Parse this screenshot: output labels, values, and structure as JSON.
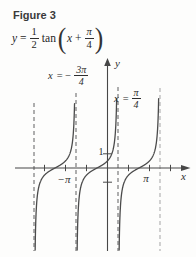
{
  "figure": {
    "title": "Figure 3",
    "equation": {
      "lhs": "y",
      "equals": "=",
      "frac1": {
        "num": "1",
        "den": "2"
      },
      "func": "tan",
      "open_paren": "(",
      "arg_var": "x",
      "plus": "+",
      "frac2": {
        "num": "π",
        "den": "4"
      },
      "close_paren": ")"
    }
  },
  "graph": {
    "axis_labels": {
      "x": "x",
      "y": "y"
    },
    "tick_labels": {
      "one": "1",
      "neg_pi": "−π",
      "pi": "π"
    },
    "asymptote_labels": {
      "left": {
        "var": "x",
        "rel": "= −",
        "num": "3π",
        "den": "4"
      },
      "right": {
        "var": "x",
        "rel": "=",
        "num": "π",
        "den": "4"
      }
    }
  },
  "chart_data": {
    "type": "line",
    "function": "y = 0.5 · tan(x + π/4)",
    "coefficient": 0.5,
    "phase_shift_rad": 0.7853981633974483,
    "period_rad": 3.141592653589793,
    "asymptotes_x_rad": [
      -5.497787143782138,
      -2.356194490192345,
      0.7853981633974483,
      3.9269908169872414
    ],
    "zeros_x_rad": [
      -3.9269908169872414,
      -0.7853981633974483,
      2.356194490192345
    ],
    "y_intercept": 0.5,
    "x_ticks_rad": [
      -4.71238898038469,
      -3.141592653589793,
      -1.5707963267948966,
      1.5707963267948966,
      3.141592653589793,
      4.71238898038469
    ],
    "x_tick_labels": [
      "",
      "−π",
      "",
      "",
      "π",
      ""
    ],
    "y_ticks": [
      1,
      -1
    ],
    "y_tick_labels": [
      "1",
      ""
    ],
    "xlim_rad": [
      -6.9,
      6.3
    ],
    "ylim": [
      -5.9,
      5.2
    ],
    "grid": false,
    "legend": false
  },
  "colors": {
    "axis": "#474747",
    "curve": "#4b4b4b",
    "dash": "#6e6e6e",
    "dash_light": "#adadad",
    "text": "#2c2c2c"
  }
}
